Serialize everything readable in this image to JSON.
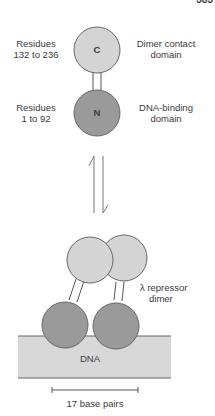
{
  "page_number": "383",
  "monomer": {
    "c_domain": {
      "glyph": "C",
      "residues_label": [
        "Residues",
        "132 to 236"
      ],
      "description": [
        "Dimer contact",
        "domain"
      ]
    },
    "n_domain": {
      "glyph": "N",
      "residues_label": [
        "Residues",
        "1 to 92"
      ],
      "description": [
        "DNA-binding",
        "domain"
      ]
    }
  },
  "equilibrium_arrows": "reversible-equilibrium",
  "dimer": {
    "label": [
      "λ repressor",
      "dimer"
    ],
    "dna_label": "DNA",
    "scale_label": "17 base pairs"
  },
  "colors": {
    "c_domain_fill": "#d4d4d4",
    "n_domain_fill": "#9a9a9a",
    "dna_fill": "#d8d8d8",
    "outline": "#555555"
  }
}
